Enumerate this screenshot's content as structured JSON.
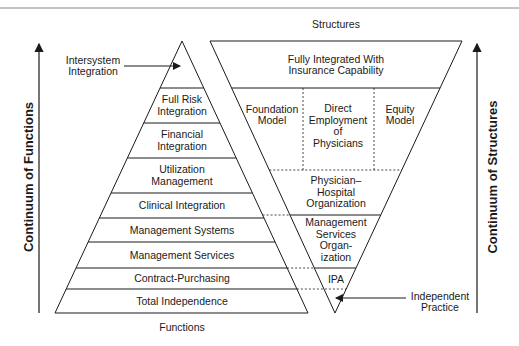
{
  "diagram": {
    "top_label": "Structures",
    "bottom_label": "Functions",
    "left_axis_label": "Continuum of Functions",
    "right_axis_label": "Continuum of Structures",
    "callouts": {
      "intersystem": [
        "Intersystem",
        "Integration"
      ],
      "independent": [
        "Independent",
        "Practice"
      ]
    },
    "functions_pyramid": [
      {
        "lines": [
          "Full Risk",
          "Integration"
        ]
      },
      {
        "lines": [
          "Financial",
          "Integration"
        ]
      },
      {
        "lines": [
          "Utilization",
          "Management"
        ]
      },
      {
        "lines": [
          "Clinical Integration"
        ]
      },
      {
        "lines": [
          "Management Systems"
        ]
      },
      {
        "lines": [
          "Management Services"
        ]
      },
      {
        "lines": [
          "Contract-Purchasing"
        ]
      },
      {
        "lines": [
          "Total Independence"
        ]
      }
    ],
    "structures_pyramid": {
      "top": [
        "Fully Integrated With",
        "Insurance Capability"
      ],
      "models": [
        {
          "lines": [
            "Foundation",
            "Model"
          ]
        },
        {
          "lines": [
            "Direct",
            "Employment",
            "of",
            "Physicians"
          ]
        },
        {
          "lines": [
            "Equity",
            "Model"
          ]
        }
      ],
      "pho": [
        "Physician–",
        "Hospital",
        "Organization"
      ],
      "mso": [
        "Management",
        "Services",
        "Organ-",
        "ization"
      ],
      "ipa": [
        "IPA"
      ]
    },
    "colors": {
      "line": "#1a1a1a",
      "rule": "#888888"
    }
  }
}
